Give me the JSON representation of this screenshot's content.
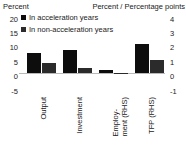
{
  "chart_data": {
    "type": "bar",
    "title": "",
    "subtitle": "",
    "left_axis_title": "Percent",
    "right_axis_title": "Percent / Percentage points",
    "xlabel": "",
    "categories": [
      "Output",
      "Investment",
      "Employ-\nment (RHS)",
      "TFP (RHS)"
    ],
    "category_lines": [
      [
        "Output"
      ],
      [
        "Investment"
      ],
      [
        "Employ-",
        "ment (RHS)"
      ],
      [
        "TFP (RHS)"
      ]
    ],
    "category_axis": [
      "left",
      "left",
      "right",
      "right"
    ],
    "series": [
      {
        "name": "In acceleration years",
        "color": "#0d0d0d",
        "values": [
          8.0,
          9.0,
          0.25,
          2.3
        ]
      },
      {
        "name": "In non-acceleration years",
        "color": "#2b2b2b",
        "values": [
          4.0,
          2.0,
          -0.1,
          1.05
        ]
      }
    ],
    "left_axis": {
      "ticks": [
        "20",
        "15",
        "10",
        "5",
        "0",
        "-5"
      ],
      "values": [
        20,
        15,
        10,
        5,
        0,
        -5
      ],
      "ylim": [
        -5,
        20
      ]
    },
    "right_axis": {
      "ticks": [
        "4",
        "3",
        "2",
        "1",
        "0",
        "-1"
      ],
      "values": [
        4,
        3,
        2,
        1,
        0,
        -1
      ],
      "ylim": [
        -1,
        4
      ]
    },
    "grid": false,
    "zero_line": true,
    "legend_position": "top-left",
    "legend": [
      {
        "label": "In acceleration years",
        "color": "#0d0d0d"
      },
      {
        "label": "In non-acceleration years",
        "color": "#2b2b2b"
      }
    ],
    "colors": {
      "acceleration": "#0d0d0d",
      "non_acceleration": "#2b2b2b",
      "zero_line": "#b9b9b9",
      "text": "#1a1a1a",
      "background": "#ffffff"
    }
  }
}
